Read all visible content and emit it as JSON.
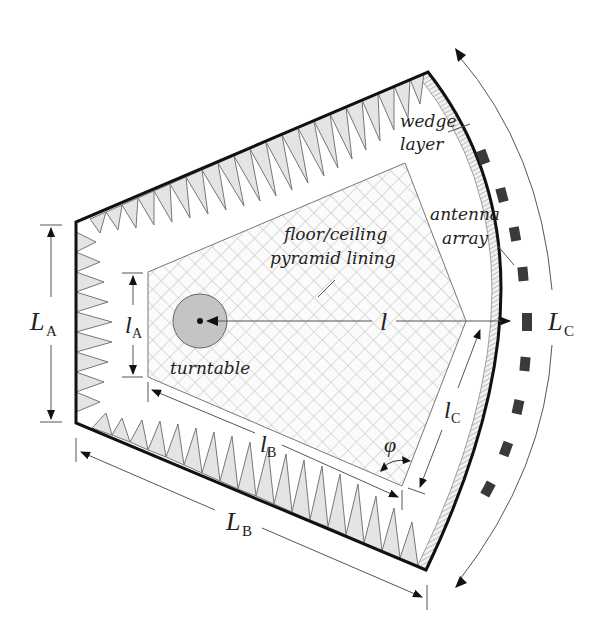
{
  "diagram": {
    "type": "anechoic-chamber-top-view",
    "labels": {
      "wedge": "wedge",
      "layer": "layer",
      "antenna": "antenna",
      "array": "array",
      "floor_ceiling": "floor/ceiling",
      "pyramid_lining": "pyramid lining",
      "turntable": "turntable",
      "l": "l",
      "phi": "φ"
    },
    "dimensions": {
      "LA": {
        "main": "L",
        "sub": "A"
      },
      "LB": {
        "main": "L",
        "sub": "B"
      },
      "LC": {
        "main": "L",
        "sub": "C"
      },
      "lA": {
        "main": "l",
        "sub": "A"
      },
      "lB": {
        "main": "l",
        "sub": "B"
      },
      "lC": {
        "main": "l",
        "sub": "C"
      }
    },
    "colors": {
      "wall": "#111111",
      "absorber_fill": "#e4e4e4",
      "hatch": "#c8c8c8",
      "antenna": "#3a3a3a",
      "turntable": "#c4c4c4"
    }
  }
}
